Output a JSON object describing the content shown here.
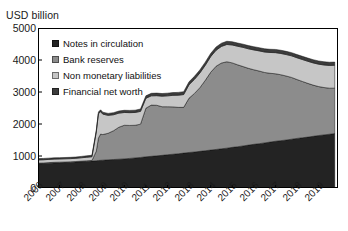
{
  "chart_data": {
    "type": "area",
    "stacked": true,
    "title": "",
    "ylabel": "USD billion",
    "xlabel": "",
    "ylim": [
      0,
      5000
    ],
    "xlim": [
      2006,
      2019.9
    ],
    "grid": false,
    "legend_position": "inside-top-left",
    "ytick_labels": [
      "5000",
      "4000",
      "3000",
      "2000",
      "1000",
      "0"
    ],
    "ytick_values": [
      5000,
      4000,
      3000,
      2000,
      1000,
      0
    ],
    "xtick_labels": [
      "2006",
      "2007",
      "2008",
      "2009",
      "2010",
      "2011",
      "2012",
      "2013",
      "2014",
      "2015",
      "2016",
      "2017",
      "2018",
      "2019"
    ],
    "xtick_values": [
      2006,
      2007,
      2008,
      2009,
      2010,
      2011,
      2012,
      2013,
      2014,
      2015,
      2016,
      2017,
      2018,
      2019
    ],
    "x": [
      2006.0,
      2006.25,
      2006.5,
      2006.75,
      2007.0,
      2007.25,
      2007.5,
      2007.75,
      2008.0,
      2008.25,
      2008.5,
      2008.7,
      2008.8,
      2008.9,
      2009.0,
      2009.25,
      2009.5,
      2009.75,
      2010.0,
      2010.25,
      2010.5,
      2010.75,
      2011.0,
      2011.25,
      2011.5,
      2011.75,
      2012.0,
      2012.25,
      2012.5,
      2012.75,
      2013.0,
      2013.25,
      2013.5,
      2013.75,
      2014.0,
      2014.25,
      2014.5,
      2014.75,
      2015.0,
      2015.25,
      2015.5,
      2015.75,
      2016.0,
      2016.25,
      2016.5,
      2016.75,
      2017.0,
      2017.25,
      2017.5,
      2017.75,
      2018.0,
      2018.25,
      2018.5,
      2018.75,
      2019.0,
      2019.25,
      2019.5,
      2019.75
    ],
    "series": [
      {
        "name": "Notes in circulation",
        "color": "#232323",
        "values": [
          760,
          765,
          775,
          785,
          790,
          795,
          800,
          810,
          820,
          830,
          840,
          850,
          860,
          865,
          870,
          880,
          890,
          900,
          910,
          925,
          940,
          955,
          975,
          990,
          1005,
          1020,
          1040,
          1055,
          1070,
          1090,
          1110,
          1125,
          1145,
          1165,
          1185,
          1205,
          1225,
          1245,
          1270,
          1290,
          1315,
          1340,
          1365,
          1385,
          1410,
          1435,
          1460,
          1480,
          1500,
          1525,
          1550,
          1570,
          1590,
          1615,
          1640,
          1660,
          1680,
          1700
        ]
      },
      {
        "name": "Bank reserves",
        "color": "#8c8c8c",
        "values": [
          18,
          18,
          18,
          18,
          18,
          18,
          18,
          18,
          20,
          20,
          22,
          300,
          700,
          820,
          800,
          830,
          900,
          1000,
          1050,
          1030,
          1020,
          1040,
          1520,
          1600,
          1580,
          1520,
          1500,
          1480,
          1450,
          1430,
          1700,
          1830,
          1990,
          2200,
          2430,
          2600,
          2680,
          2700,
          2640,
          2560,
          2480,
          2400,
          2330,
          2270,
          2200,
          2150,
          2110,
          2060,
          2000,
          1930,
          1840,
          1760,
          1680,
          1600,
          1530,
          1480,
          1440,
          1420
        ]
      },
      {
        "name": "Non monetary liabilities",
        "color": "#c6c6c6",
        "values": [
          100,
          100,
          100,
          100,
          100,
          100,
          100,
          100,
          105,
          110,
          115,
          600,
          760,
          700,
          640,
          560,
          500,
          440,
          400,
          400,
          400,
          400,
          310,
          290,
          300,
          330,
          340,
          360,
          380,
          400,
          420,
          440,
          460,
          470,
          490,
          500,
          520,
          540,
          560,
          580,
          600,
          610,
          620,
          630,
          640,
          650,
          660,
          665,
          670,
          675,
          680,
          685,
          690,
          695,
          700,
          705,
          710,
          715
        ]
      },
      {
        "name": "Financial net worth",
        "color": "#3c3c3c",
        "values": [
          40,
          40,
          40,
          40,
          40,
          40,
          40,
          40,
          42,
          44,
          46,
          50,
          55,
          58,
          60,
          62,
          64,
          66,
          68,
          70,
          72,
          74,
          76,
          78,
          80,
          82,
          84,
          86,
          88,
          90,
          92,
          94,
          96,
          98,
          100,
          100,
          100,
          100,
          100,
          100,
          100,
          100,
          100,
          100,
          100,
          100,
          100,
          100,
          100,
          100,
          100,
          100,
          100,
          100,
          100,
          100,
          100,
          100
        ]
      }
    ]
  },
  "legend": {
    "items": [
      {
        "label": "Notes in circulation",
        "color": "#232323"
      },
      {
        "label": "Bank reserves",
        "color": "#8c8c8c"
      },
      {
        "label": "Non monetary liabilities",
        "color": "#c6c6c6"
      },
      {
        "label": "Financial net worth",
        "color": "#3c3c3c"
      }
    ]
  }
}
